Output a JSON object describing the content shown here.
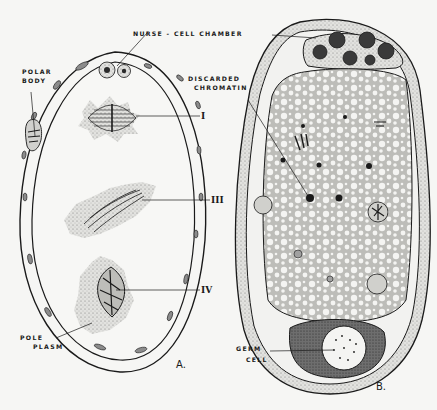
{
  "figure": {
    "panels": [
      {
        "id": "A",
        "label": "A."
      },
      {
        "id": "B",
        "label": "B."
      }
    ],
    "labels": {
      "nurse_cell_chamber": "NURSE - CELL CHAMBER",
      "polar_body_1": "POLAR",
      "polar_body_2": "BODY",
      "discarded_1": "DISCARDED",
      "discarded_2": "CHROMATIN",
      "pole_plasm_1": "POLE",
      "pole_plasm_2": "PLASM",
      "germ_cell_1": "GERM",
      "germ_cell_2": "CELL",
      "stage_1": "I",
      "stage_3": "III",
      "stage_4": "IV"
    },
    "colors": {
      "ink": "#1a1a1a",
      "paper": "#f6f6f4",
      "stipple": "#9a9a9a",
      "cytoplasm": "#c9c9c6"
    }
  }
}
